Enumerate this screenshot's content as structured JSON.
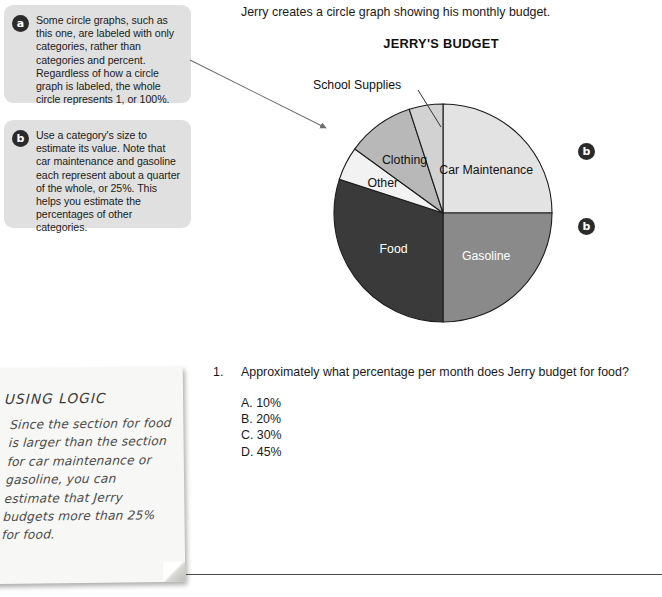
{
  "callouts": [
    {
      "badge": "a",
      "text": "Some circle graphs, such as this one, are labeled with only categories, rather than categories and percent. Regardless of how a circle graph is labeled, the whole circle represents 1, or 100%."
    },
    {
      "badge": "b",
      "text": "Use a category's size to estimate its value. Note that car maintenance and gasoline each represent about a quarter of the whole, or 25%. This helps you estimate the percentages of other categories."
    }
  ],
  "intro_text": "Jerry creates a circle graph showing his monthly budget.",
  "side_badges": [
    {
      "label": "b"
    },
    {
      "label": "b"
    }
  ],
  "chart_data": {
    "type": "pie",
    "title": "JERRY'S BUDGET",
    "legend_position": "none",
    "labels_shown_as": "categories only (no percents)",
    "total": 100,
    "categories": [
      "Car Maintenance",
      "Gasoline",
      "Food",
      "Other",
      "Clothing",
      "School Supplies"
    ],
    "values": [
      25,
      25,
      30,
      5,
      10,
      5
    ],
    "colors": [
      "#e3e3e3",
      "#8a8a8a",
      "#3a3a3a",
      "#f2f2f2",
      "#b8b8b8",
      "#d2d2d2"
    ],
    "label_colors": [
      "#111111",
      "#ffffff",
      "#ffffff",
      "#111111",
      "#111111",
      "#111111"
    ],
    "start_angle_deg": 0,
    "direction": "clockwise",
    "slices": [
      {
        "name": "Car Maintenance",
        "value": 25,
        "angle_deg": 90,
        "color": "#e3e3e3",
        "label_inside": true
      },
      {
        "name": "Gasoline",
        "value": 25,
        "angle_deg": 90,
        "color": "#8a8a8a",
        "label_inside": true
      },
      {
        "name": "Food",
        "value": 30,
        "angle_deg": 108,
        "color": "#3a3a3a",
        "label_inside": true
      },
      {
        "name": "Other",
        "value": 5,
        "angle_deg": 18,
        "color": "#f2f2f2",
        "label_inside": true
      },
      {
        "name": "Clothing",
        "value": 10,
        "angle_deg": 36,
        "color": "#b8b8b8",
        "label_inside": true
      },
      {
        "name": "School Supplies",
        "value": 5,
        "angle_deg": 18,
        "color": "#d2d2d2",
        "label_inside": false
      }
    ],
    "external_label": "School Supplies"
  },
  "question": {
    "number": "1.",
    "text": "Approximately what percentage per month does Jerry budget for food?",
    "options": [
      "A. 10%",
      "B. 20%",
      "C. 30%",
      "D. 45%"
    ]
  },
  "sticky_note": {
    "title": "USING LOGIC",
    "body": "Since the section for food is larger than the section for car maintenance or gasoline, you can estimate that Jerry budgets more than 25% for food."
  }
}
